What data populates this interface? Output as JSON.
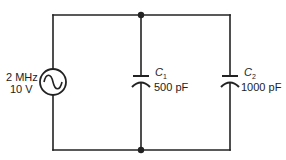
{
  "diagram": {
    "type": "circuit-schematic",
    "source": {
      "symbol": "ac-voltage-source",
      "frequency_label": "2 MHz",
      "voltage_label": "10 V"
    },
    "capacitors": [
      {
        "name": "C",
        "subscript": "1",
        "value": "500 pF"
      },
      {
        "name": "C",
        "subscript": "2",
        "value": "1000 pF"
      }
    ],
    "topology": "source and two capacitors in parallel",
    "colors": {
      "wire": "#222222",
      "background": "#ffffff"
    }
  }
}
